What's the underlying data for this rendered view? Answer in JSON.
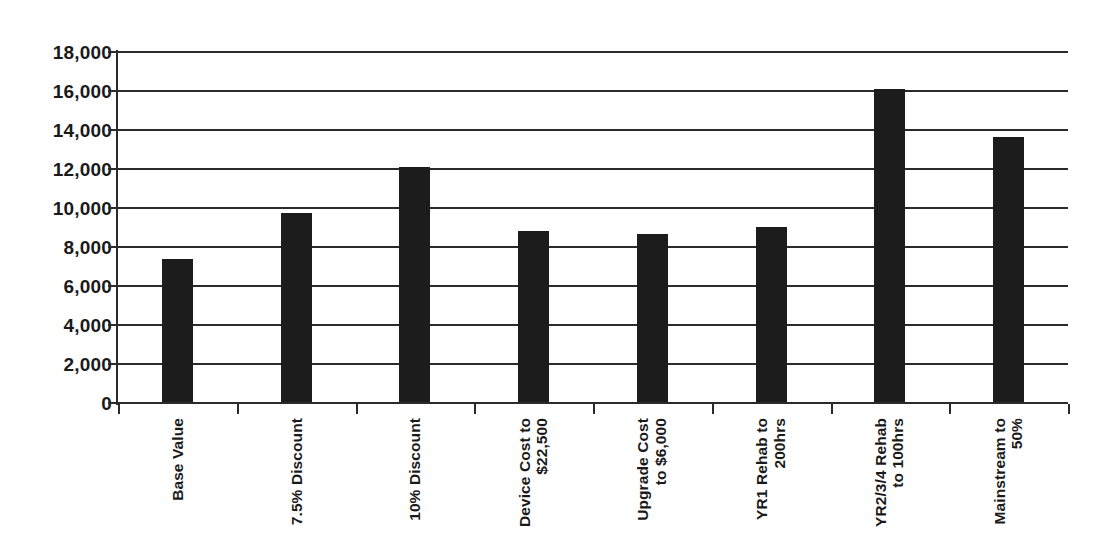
{
  "chart_data": {
    "type": "bar",
    "title": "",
    "subtitle": "",
    "xlabel": "",
    "ylabel": "",
    "ylim": [
      0,
      18000
    ],
    "ytick_step": 2000,
    "grid": true,
    "legend": false,
    "legend_position": "none",
    "bar_color": "#1c1c1c",
    "background_color": "#ffffff",
    "axis_color": "#2b2b2b",
    "categories": [
      "Base Value",
      "7.5% Discount",
      "10% Discount",
      "Device Cost to $22,500",
      "Upgrade Cost to $6,000",
      "YR1 Rehab to 200hrs",
      "YR2/3/4 Rehab to 100hrs",
      "Mainstream to 50%"
    ],
    "category_lines": [
      [
        "Base Value"
      ],
      [
        "7.5% Discount"
      ],
      [
        "10% Discount"
      ],
      [
        "Device Cost to",
        "$22,500"
      ],
      [
        "Upgrade Cost",
        "to $6,000"
      ],
      [
        "YR1 Rehab to",
        "200hrs"
      ],
      [
        "YR2/3/4 Rehab",
        "to 100hrs"
      ],
      [
        "Mainstream to",
        "50%"
      ]
    ],
    "values": [
      7400,
      9750,
      12100,
      8800,
      8650,
      9050,
      16100,
      13650
    ],
    "ytick_labels": [
      "18,000",
      "16,000",
      "14,000",
      "12,000",
      "10,000",
      "8,000",
      "6,000",
      "4,000",
      "2,000",
      "0"
    ],
    "ytick_values": [
      18000,
      16000,
      14000,
      12000,
      10000,
      8000,
      6000,
      4000,
      2000,
      0
    ]
  }
}
